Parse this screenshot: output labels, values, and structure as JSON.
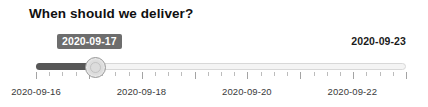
{
  "widget": {
    "title": "When should we deliver?",
    "type": "date-range-slider"
  },
  "slider": {
    "current_value_label": "2020-09-17",
    "max_value_label": "2020-09-23",
    "min_value": "2020-09-16",
    "max_value": "2020-09-23",
    "current_value": "2020-09-17",
    "fill_color": "#575757",
    "track_color": "#f4f4f4",
    "handle_color": "#dcdcdc",
    "badge_bg_color": "#6d6d6d",
    "badge_text_color": "#ffffff",
    "fill_percent": 17,
    "handle_percent": 16
  },
  "axis": {
    "labels": [
      {
        "text": "2020-09-16",
        "percent": 0
      },
      {
        "text": "2020-09-18",
        "percent": 28.5
      },
      {
        "text": "2020-09-20",
        "percent": 57
      },
      {
        "text": "2020-09-22",
        "percent": 85.5
      }
    ],
    "tick_count": 29,
    "major_tick_every": 4
  }
}
